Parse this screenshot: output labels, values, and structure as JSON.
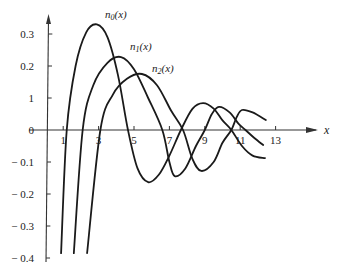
{
  "chart_data": {
    "type": "line",
    "title": "",
    "xlabel": "x",
    "ylabel": "",
    "xlim": [
      0,
      15
    ],
    "ylim": [
      -0.42,
      0.36
    ],
    "grid": false,
    "x_ticks": [
      1,
      3,
      5,
      7,
      9,
      11,
      13
    ],
    "x_tick_labels": [
      "1",
      "3",
      "5",
      "7",
      "9",
      "11",
      "13"
    ],
    "y_ticks": [
      0.3,
      0.2,
      0.1,
      0,
      -0.1,
      -0.2,
      -0.3,
      -0.4
    ],
    "y_tick_labels": [
      "0.3",
      "0.2",
      "1",
      "0",
      "− 0.1",
      "− 0.2",
      "− 0.3",
      "− 0.4"
    ],
    "series": [
      {
        "name": "n0(x)",
        "label_main": "n",
        "label_sub": "0",
        "label_tail": "(x)",
        "points": [
          [
            0.88,
            -0.385
          ],
          [
            1.2,
            0
          ],
          [
            1.7,
            0.2
          ],
          [
            2.3,
            0.305
          ],
          [
            2.9,
            0.33
          ],
          [
            3.5,
            0.29
          ],
          [
            4.1,
            0.17
          ],
          [
            4.66,
            0
          ],
          [
            5.2,
            -0.12
          ],
          [
            5.8,
            -0.163
          ],
          [
            6.4,
            -0.14
          ],
          [
            7.0,
            -0.08
          ],
          [
            7.65,
            0
          ],
          [
            8.3,
            0.066
          ],
          [
            8.9,
            0.084
          ],
          [
            9.5,
            0.067
          ],
          [
            10.0,
            0.03
          ],
          [
            10.5,
            0
          ],
          [
            11.1,
            -0.05
          ],
          [
            11.7,
            -0.08
          ],
          [
            12.4,
            -0.088
          ]
        ]
      },
      {
        "name": "n1(x)",
        "label_main": "n",
        "label_sub": "1",
        "label_tail": "(x)",
        "points": [
          [
            1.6,
            -0.385
          ],
          [
            2.1,
            0
          ],
          [
            2.7,
            0.14
          ],
          [
            3.5,
            0.21
          ],
          [
            4.27,
            0.228
          ],
          [
            5.0,
            0.19
          ],
          [
            5.8,
            0.1
          ],
          [
            6.6,
            0
          ],
          [
            7.0,
            -0.1
          ],
          [
            7.3,
            -0.144
          ],
          [
            7.9,
            -0.12
          ],
          [
            8.5,
            -0.05
          ],
          [
            9.0,
            0
          ],
          [
            9.4,
            0.05
          ],
          [
            9.8,
            0.072
          ],
          [
            10.4,
            0.055
          ],
          [
            10.9,
            0.02
          ],
          [
            11.3,
            0
          ],
          [
            11.8,
            -0.025
          ],
          [
            12.3,
            -0.047
          ]
        ]
      },
      {
        "name": "n2(x)",
        "label_main": "n",
        "label_sub": "2",
        "label_tail": "(x)",
        "points": [
          [
            2.35,
            -0.385
          ],
          [
            3.1,
            0
          ],
          [
            3.8,
            0.11
          ],
          [
            4.6,
            0.16
          ],
          [
            5.45,
            0.175
          ],
          [
            6.3,
            0.14
          ],
          [
            7.1,
            0.06
          ],
          [
            7.77,
            0
          ],
          [
            8.3,
            -0.09
          ],
          [
            8.8,
            -0.128
          ],
          [
            9.5,
            -0.1
          ],
          [
            10.0,
            -0.04
          ],
          [
            10.5,
            0
          ],
          [
            10.8,
            0.04
          ],
          [
            11.1,
            0.0625
          ],
          [
            11.7,
            0.055
          ],
          [
            12.45,
            0.031
          ]
        ]
      }
    ]
  }
}
